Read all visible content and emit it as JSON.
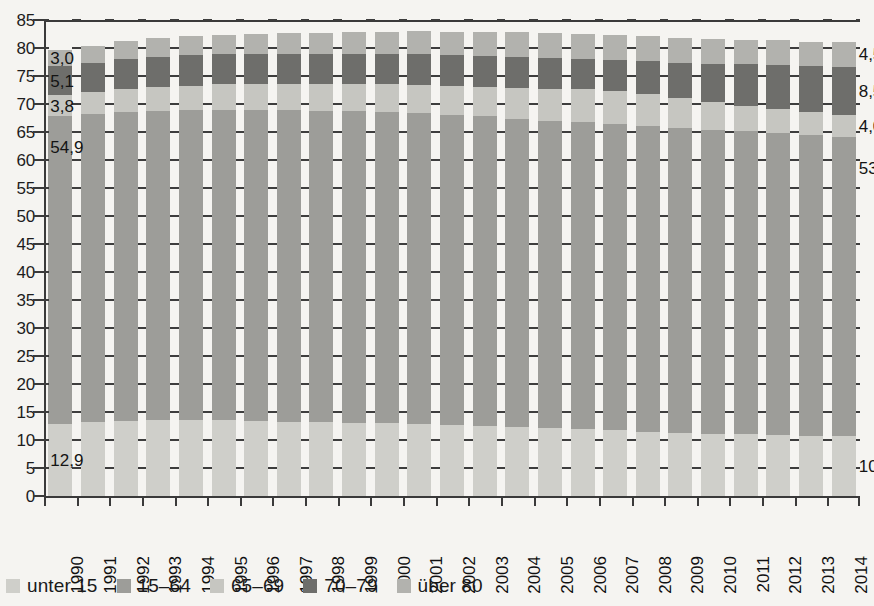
{
  "chart_data": {
    "type": "bar",
    "stacked": true,
    "title": "",
    "subtitle": "",
    "xlabel": "",
    "ylabel": "",
    "ylim": [
      0,
      85
    ],
    "ytick_step": 5,
    "grid": true,
    "legend_position": "bottom-left",
    "categories": [
      "1990",
      "1991",
      "1992",
      "1993",
      "1994",
      "1995",
      "1996",
      "1997",
      "1998",
      "1999",
      "2000",
      "2001",
      "2002",
      "2003",
      "2004",
      "2005",
      "2006",
      "2007",
      "2008",
      "2009",
      "2010",
      "2011",
      "2012",
      "2013",
      "2014"
    ],
    "ytick_labels": [
      "0",
      "5",
      "10",
      "15",
      "20",
      "25",
      "30",
      "35",
      "40",
      "45",
      "50",
      "55",
      "60",
      "65",
      "70",
      "75",
      "80",
      "85"
    ],
    "series": [
      {
        "name": "unter 15",
        "color": "#cfcfca",
        "values": [
          12.9,
          13.2,
          13.4,
          13.5,
          13.5,
          13.5,
          13.4,
          13.3,
          13.2,
          13.1,
          13.0,
          12.9,
          12.7,
          12.5,
          12.3,
          12.1,
          11.9,
          11.7,
          11.5,
          11.3,
          11.1,
          11.0,
          10.9,
          10.8,
          10.7
        ]
      },
      {
        "name": "15–64",
        "color": "#9d9d99",
        "values": [
          54.9,
          55.0,
          55.2,
          55.3,
          55.4,
          55.5,
          55.5,
          55.6,
          55.6,
          55.6,
          55.6,
          55.5,
          55.4,
          55.3,
          55.1,
          54.9,
          54.8,
          54.7,
          54.6,
          54.4,
          54.3,
          54.1,
          53.9,
          53.6,
          53.4
        ]
      },
      {
        "name": "65–69",
        "color": "#c6c6c1",
        "values": [
          3.8,
          3.9,
          4.1,
          4.2,
          4.4,
          4.5,
          4.6,
          4.6,
          4.7,
          4.8,
          4.9,
          5.0,
          5.1,
          5.3,
          5.5,
          5.7,
          5.9,
          5.9,
          5.7,
          5.4,
          5.0,
          4.6,
          4.3,
          4.1,
          4.0
        ]
      },
      {
        "name": "70–79",
        "color": "#6e6e6b",
        "values": [
          5.1,
          5.2,
          5.3,
          5.4,
          5.4,
          5.4,
          5.4,
          5.4,
          5.4,
          5.4,
          5.4,
          5.5,
          5.5,
          5.5,
          5.5,
          5.5,
          5.5,
          5.6,
          5.9,
          6.3,
          6.8,
          7.4,
          7.9,
          8.2,
          8.5
        ]
      },
      {
        "name": "über 80",
        "color": "#b2b2ae",
        "values": [
          3.0,
          3.1,
          3.2,
          3.3,
          3.4,
          3.5,
          3.6,
          3.7,
          3.8,
          3.9,
          4.0,
          4.1,
          4.2,
          4.3,
          4.4,
          4.4,
          4.4,
          4.4,
          4.4,
          4.4,
          4.4,
          4.4,
          4.4,
          4.4,
          4.5
        ]
      }
    ],
    "annotations": [
      {
        "text": "3,0",
        "series": "über 80",
        "side": "left",
        "category": "1990"
      },
      {
        "text": "5,1",
        "series": "70–79",
        "side": "left",
        "category": "1990"
      },
      {
        "text": "3,8",
        "series": "65–69",
        "side": "left",
        "category": "1990"
      },
      {
        "text": "54,9",
        "series": "15–64",
        "side": "left",
        "category": "1990"
      },
      {
        "text": "12,9",
        "series": "unter 15",
        "side": "left",
        "category": "1990"
      },
      {
        "text": "4,5",
        "series": "über 80",
        "side": "right",
        "category": "2014"
      },
      {
        "text": "8,5",
        "series": "70–79",
        "side": "right",
        "category": "2014"
      },
      {
        "text": "4,0",
        "series": "65–69",
        "side": "right",
        "category": "2014"
      },
      {
        "text": "53,4",
        "series": "15–64",
        "side": "right",
        "category": "2014"
      },
      {
        "text": "10,7",
        "series": "unter 15",
        "side": "right",
        "category": "2014"
      }
    ]
  },
  "legend": {
    "items": [
      {
        "label": "unter 15",
        "color": "#cfcfca"
      },
      {
        "label": "15–64",
        "color": "#9d9d99"
      },
      {
        "label": "65–69",
        "color": "#c6c6c1"
      },
      {
        "label": "70–79",
        "color": "#6e6e6b"
      },
      {
        "label": "über 80",
        "color": "#b2b2ae"
      }
    ]
  }
}
